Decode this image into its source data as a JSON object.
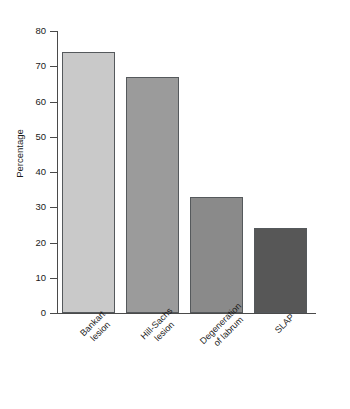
{
  "chart_data": {
    "type": "bar",
    "title": "",
    "subtitle": "",
    "xlabel": "",
    "ylabel": "Percentage",
    "categories": [
      "Bankart\nlesion",
      "Hill-Sachs\nlesion",
      "Degeneration\nof labrum",
      "SLAP"
    ],
    "values": [
      74,
      67,
      33,
      24
    ],
    "ylim": [
      0,
      80
    ],
    "ytick_labels": [
      "0",
      "10",
      "20",
      "30",
      "40",
      "50",
      "60",
      "70",
      "80"
    ],
    "ytick_values": [
      0,
      10,
      20,
      30,
      40,
      50,
      60,
      70,
      80
    ],
    "grid": false,
    "legend": false,
    "legend_position": "none",
    "bar_colors": [
      "#c9c9c9",
      "#9b9b9b",
      "#8a8a8a",
      "#575757"
    ],
    "bar_edge_color": "#55595c",
    "axis_color": "#4a4a4a",
    "background": "#ffffff",
    "series": [
      {
        "name": "Percentage",
        "values": [
          74,
          67,
          33,
          24
        ]
      }
    ]
  }
}
